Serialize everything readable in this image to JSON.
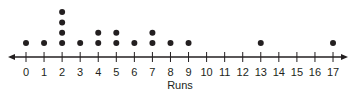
{
  "chart_data": {
    "type": "dot plot",
    "title": "",
    "xlabel": "Runs",
    "ylabel": "",
    "xlim": [
      0,
      17
    ],
    "ticks": [
      0,
      1,
      2,
      3,
      4,
      5,
      6,
      7,
      8,
      9,
      10,
      11,
      12,
      13,
      14,
      15,
      16,
      17
    ],
    "tick_labels": [
      "0",
      "1",
      "2",
      "3",
      "4",
      "5",
      "6",
      "7",
      "8",
      "9",
      "10",
      "11",
      "12",
      "13",
      "14",
      "15",
      "16",
      "17"
    ],
    "x": [
      0,
      1,
      2,
      3,
      4,
      5,
      6,
      7,
      8,
      9,
      13,
      17
    ],
    "counts": [
      1,
      1,
      4,
      1,
      2,
      2,
      1,
      2,
      1,
      1,
      1,
      1
    ],
    "arrows": "both ends",
    "grid": false
  },
  "colors": {
    "dot": "#231f20",
    "axis": "#231f20",
    "text": "#231f20"
  }
}
